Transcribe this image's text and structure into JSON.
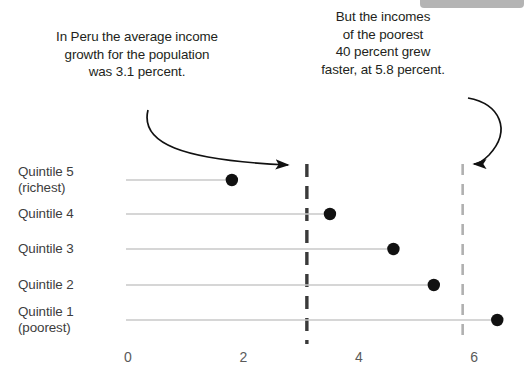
{
  "decor": {
    "watermark_bar": "cropped-gray-bar"
  },
  "annotations": {
    "left": {
      "text": "In Peru the average income\ngrowth for the population\nwas 3.1 percent.",
      "arrow": "curved-arrow-to-average-line"
    },
    "right": {
      "text": "But the incomes\nof the poorest\n40 percent grew\nfaster, at 5.8 percent.",
      "arrow": "curved-arrow-to-bottom40-line"
    }
  },
  "chart_data": {
    "type": "bar",
    "title": "",
    "subtitle": "",
    "xlabel": "",
    "ylabel": "",
    "xlim": [
      0,
      6.8
    ],
    "grid": false,
    "legend": "none",
    "orientation": "horizontal",
    "categories": [
      "Quintile 5\n(richest)",
      "Quintile 4",
      "Quintile 3",
      "Quintile 2",
      "Quintile 1\n(poorest)"
    ],
    "values": [
      1.8,
      3.5,
      4.6,
      5.3,
      6.4
    ],
    "xticks": [
      0,
      2,
      4,
      6
    ],
    "xtick_labels": [
      "0",
      "2",
      "4",
      "6"
    ],
    "reference_lines": [
      {
        "name": "population-average",
        "value": 3.1,
        "label": "3.1 percent",
        "color": "#3a3a3a",
        "style": "dashed"
      },
      {
        "name": "poorest-40-percent",
        "value": 5.8,
        "label": "5.8 percent",
        "color": "#b0b0b0",
        "style": "dashed"
      }
    ],
    "marker_color": "#111111",
    "stem_color": "#c9c9c9"
  }
}
